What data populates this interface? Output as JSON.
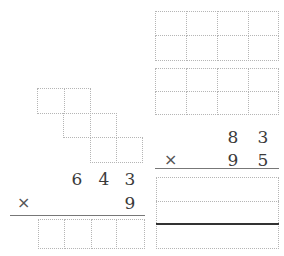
{
  "left_problem": {
    "multiplicand_digits": [
      "6",
      "4",
      "3"
    ],
    "operator": "×",
    "multiplier_digits": [
      "9"
    ],
    "answer_boxes": 4
  },
  "right_problem": {
    "multiplicand_digits": [
      "8",
      "3"
    ],
    "operator": "×",
    "multiplier_digits": [
      "9",
      "5"
    ],
    "answer_rows": 3
  },
  "staircase_grid": {
    "rows": [
      [
        0,
        1
      ],
      [
        1,
        2
      ],
      [
        2,
        3
      ]
    ]
  },
  "top_right_grids": [
    {
      "cols": 4,
      "rows": 2
    },
    {
      "cols": 4,
      "rows": 2
    }
  ]
}
